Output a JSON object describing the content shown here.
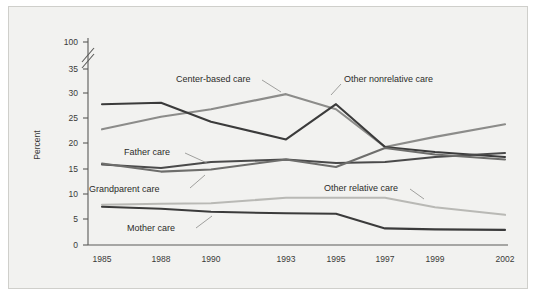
{
  "chart_data": {
    "type": "line",
    "title": "",
    "xlabel": "",
    "ylabel": "Percent",
    "categories": [
      "1985",
      "1988",
      "1990",
      "1993",
      "1995",
      "1997",
      "1999",
      "2002"
    ],
    "x_tick_labels": [
      "1985",
      "1988",
      "1990",
      "1993",
      "1995",
      "1997",
      "1999",
      "2002"
    ],
    "y_tick_labels": [
      "0",
      "5",
      "10",
      "15",
      "20",
      "25",
      "30",
      "35",
      "100"
    ],
    "y_tick_values": [
      0,
      5,
      10,
      15,
      20,
      25,
      30,
      35,
      100
    ],
    "ylim": [
      0,
      37
    ],
    "axis_break": "between 35 and 100",
    "grid": "off",
    "legend_position": "inline-annotations",
    "series": [
      {
        "name": "Center-based care",
        "color": "#8c8c8a",
        "values": [
          23.0,
          25.5,
          27.0,
          30.0,
          27.0,
          19.5,
          21.5,
          24.0
        ]
      },
      {
        "name": "Other nonrelative care",
        "color": "#3b3b3b",
        "values": [
          28.0,
          28.3,
          24.5,
          21.0,
          28.0,
          19.5,
          18.5,
          17.5
        ]
      },
      {
        "name": "Father care",
        "color": "#4a4a4a",
        "values": [
          16.0,
          15.3,
          16.5,
          17.0,
          16.3,
          16.5,
          17.5,
          18.3
        ]
      },
      {
        "name": "Grandparent care",
        "color": "#6e6e6c",
        "values": [
          16.2,
          14.6,
          15.0,
          17.0,
          15.5,
          19.3,
          18.0,
          17.0
        ]
      },
      {
        "name": "Other relative care",
        "color": "#b9b9b5",
        "values": [
          8.0,
          8.2,
          8.3,
          9.4,
          9.4,
          9.4,
          7.5,
          6.0
        ]
      },
      {
        "name": "Mother care",
        "color": "#3b3b3b",
        "values": [
          7.6,
          7.2,
          6.6,
          6.3,
          6.2,
          3.3,
          3.1,
          3.0
        ]
      }
    ],
    "annotations": [
      {
        "text": "Center-based care",
        "series": "Center-based care"
      },
      {
        "text": "Other nonrelative care",
        "series": "Other nonrelative care"
      },
      {
        "text": "Father care",
        "series": "Father care"
      },
      {
        "text": "Grandparent care",
        "series": "Grandparent care"
      },
      {
        "text": "Other relative care",
        "series": "Other relative care"
      },
      {
        "text": "Mother care",
        "series": "Mother care"
      }
    ]
  },
  "axis": {
    "ylabel": "Percent",
    "y_ticks": [
      "100",
      "35",
      "30",
      "25",
      "20",
      "15",
      "10",
      "5",
      "0"
    ],
    "x_ticks": [
      "1985",
      "1988",
      "1990",
      "1993",
      "1995",
      "1997",
      "1999",
      "2002"
    ]
  },
  "labels": {
    "center_based": "Center-based care",
    "other_nonrelative": "Other nonrelative care",
    "father": "Father care",
    "grandparent": "Grandparent care",
    "other_relative": "Other relative care",
    "mother": "Mother care"
  }
}
